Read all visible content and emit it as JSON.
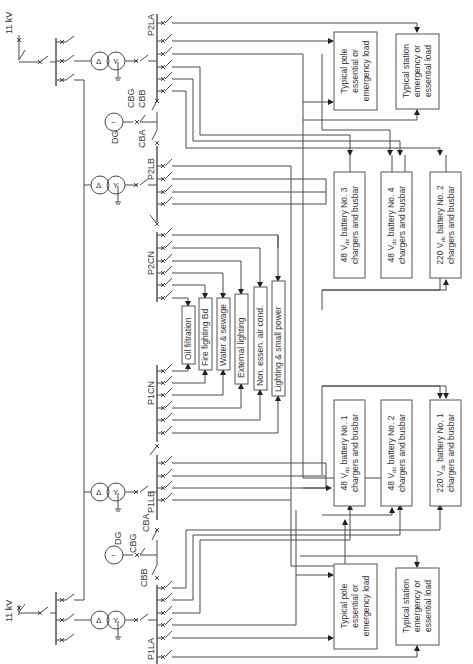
{
  "diagram": {
    "orientation": "rotated-90-ccw",
    "supplies": [
      {
        "id": "top",
        "label": "11 kV"
      },
      {
        "id": "bottom",
        "label": "11 kV"
      }
    ],
    "generators": [
      {
        "id": "dg-top",
        "label": "DG",
        "symbol": "~"
      },
      {
        "id": "dg-bottom",
        "label": "DG",
        "symbol": "~"
      }
    ],
    "transformer_symbols": {
      "primary": "Δ",
      "secondary": "Y"
    },
    "breakers": {
      "top": {
        "gen": "CBG",
        "a": "CBA",
        "b": "CBB"
      },
      "bottom": {
        "gen": "CBG",
        "a": "CBA",
        "b": "CBB"
      }
    },
    "busbars": {
      "p2la": "P2LA",
      "p2lb": "P2LB",
      "p2cn": "P2CN",
      "p1cn": "P1CN",
      "p1lb": "P1LB",
      "p1la": "P1LA"
    },
    "loads_common": [
      "Oil filtration",
      "Fire fighting Bd",
      "Water & sewage",
      "External lighting",
      "Non. essen. air cond.",
      "Lighting & small power"
    ],
    "loads_top": {
      "pole": [
        "Typical pole",
        "essential or",
        "emergency load"
      ],
      "station": [
        "Typical station",
        "emergency or",
        "essential load"
      ]
    },
    "loads_bottom": {
      "pole": [
        "Typical pole",
        "essential or",
        "emergency load"
      ],
      "station": [
        "Typical station",
        "emergency or",
        "essential load"
      ]
    },
    "battery_top": [
      {
        "line1": "48 V",
        "sub": "dc",
        "line1b": " battery No. 3",
        "line2": "chargers and busbar"
      },
      {
        "line1": "48 V",
        "sub": "dc",
        "line1b": " battery No. 4",
        "line2": "chargers and busbar"
      },
      {
        "line1": "220 V",
        "sub": "dc",
        "line1b": " battery No. 2",
        "line2": "chargers and busbar"
      }
    ],
    "battery_bottom": [
      {
        "line1": "48 V",
        "sub": "dc",
        "line1b": " battery No. 1",
        "line2": "chargers and busbar"
      },
      {
        "line1": "48 V",
        "sub": "dc",
        "line1b": " battery No. 2",
        "line2": "chargers and busbar"
      },
      {
        "line1": "220 V",
        "sub": "dc",
        "line1b": " battery No. 1",
        "line2": "chargers and busbar"
      }
    ],
    "colors": {
      "line": "#4a4a4a",
      "text": "#333333",
      "background": "#ffffff"
    }
  }
}
